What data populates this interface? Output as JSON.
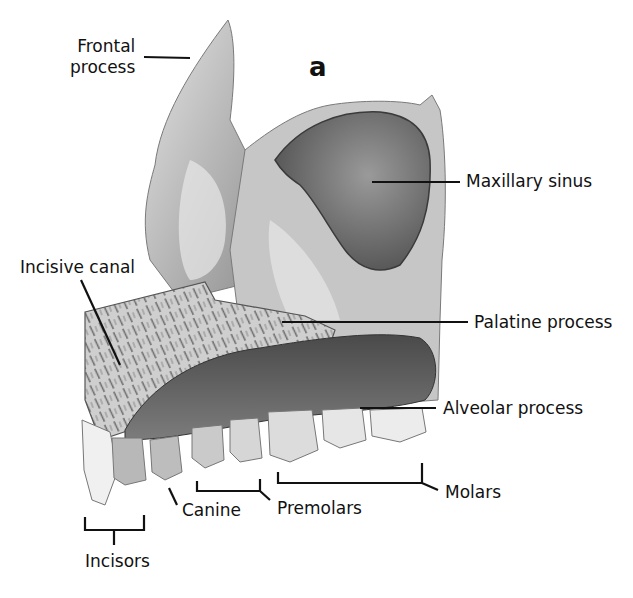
{
  "figure": {
    "panel_letter": "a"
  },
  "labels": {
    "frontal_process": [
      "Frontal",
      "process"
    ],
    "maxillary_sinus": "Maxillary sinus",
    "incisive_canal": "Incisive canal",
    "palatine_process": "Palatine process",
    "alveolar_process": "Alveolar process",
    "molars": "Molars",
    "premolars": "Premolars",
    "canine": "Canine",
    "incisors": "Incisors"
  },
  "colors": {
    "background": "#ffffff",
    "bone_light": "#d8d8d8",
    "bone_mid": "#a9a9a9",
    "bone_dark": "#6e6e6e",
    "sinus": "#7a7a7a",
    "palate": "#6a6a6a",
    "tooth": "#dedede",
    "leader_line": "#111111"
  }
}
